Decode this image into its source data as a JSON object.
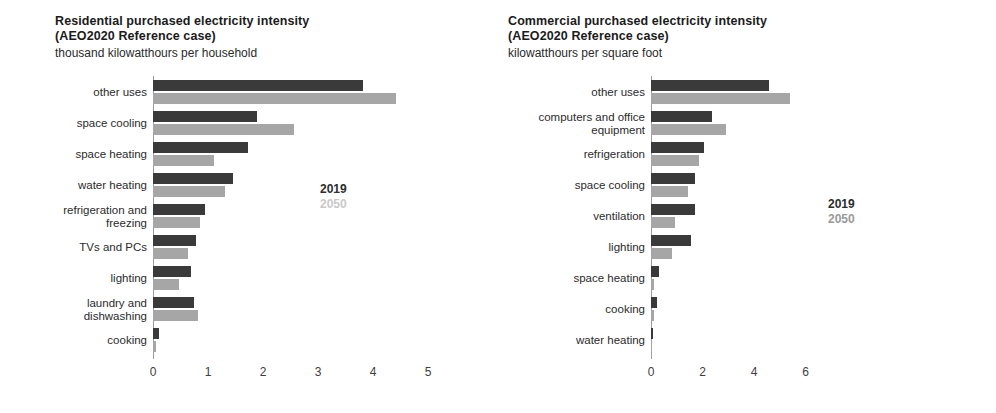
{
  "chart_data": [
    {
      "type": "bar",
      "orientation": "horizontal",
      "title": "Residential purchased electricity intensity",
      "title_line2": "(AEO2020 Reference case)",
      "subtitle": "thousand kilowatthours per household",
      "xlabel": "",
      "ylabel": "",
      "xlim": [
        0,
        5
      ],
      "xticks": [
        "0",
        "1",
        "2",
        "3",
        "4",
        "5"
      ],
      "grid": false,
      "legend": [
        "2019",
        "2050"
      ],
      "legend_position": "inside-right",
      "colors": {
        "2019": "#3a3a3a",
        "2050": "#a6a6a6"
      },
      "categories": [
        "other uses",
        "space cooling",
        "space heating",
        "water heating",
        "refrigeration and\nfreezing",
        "TVs and PCs",
        "lighting",
        "laundry and\ndishwashing",
        "cooking"
      ],
      "series": [
        {
          "name": "2019",
          "values": [
            3.81,
            1.89,
            1.72,
            1.46,
            0.95,
            0.78,
            0.69,
            0.75,
            0.1
          ]
        },
        {
          "name": "2050",
          "values": [
            4.42,
            2.57,
            1.11,
            1.31,
            0.86,
            0.64,
            0.47,
            0.81,
            0.05
          ]
        }
      ]
    },
    {
      "type": "bar",
      "orientation": "horizontal",
      "title": "Commercial purchased electricity intensity",
      "title_line2": "(AEO2020 Reference case)",
      "subtitle": "kilowatthours per square foot",
      "xlabel": "",
      "ylabel": "",
      "xlim": [
        0,
        6
      ],
      "xticks": [
        "0",
        "2",
        "4",
        "6"
      ],
      "grid": false,
      "legend": [
        "2019",
        "2050"
      ],
      "legend_position": "inside-right",
      "colors": {
        "2019": "#3a3a3a",
        "2050": "#a6a6a6"
      },
      "categories": [
        "other uses",
        "computers and office\nequipment",
        "refrigeration",
        "space cooling",
        "ventilation",
        "lighting",
        "space heating",
        "cooking",
        "water heating"
      ],
      "series": [
        {
          "name": "2019",
          "values": [
            4.6,
            2.35,
            2.05,
            1.7,
            1.7,
            1.55,
            0.33,
            0.22,
            0.07
          ]
        },
        {
          "name": "2050",
          "values": [
            5.4,
            2.9,
            1.85,
            1.45,
            0.95,
            0.8,
            0.13,
            0.12,
            0.03
          ]
        }
      ]
    }
  ],
  "left": {
    "title_line1": "Residential purchased electricity intensity",
    "title_line2": "(AEO2020 Reference case)",
    "subtitle": "thousand kilowatthours per household",
    "legend_2019": "2019",
    "legend_2050": "2050"
  },
  "right": {
    "title_line1": "Commercial purchased electricity intensity",
    "title_line2": "(AEO2020 Reference case)",
    "subtitle": "kilowatthours per square foot",
    "legend_2019": "2019",
    "legend_2050": "2050"
  }
}
